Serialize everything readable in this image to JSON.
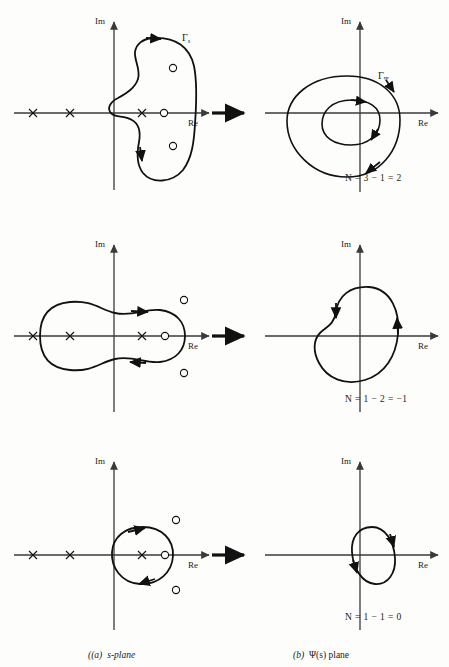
{
  "figure": {
    "type": "diagram",
    "columns": [
      {
        "key": "a",
        "caption_marker": "(a)",
        "caption_text": "s-plane"
      },
      {
        "key": "b",
        "caption_marker": "(b)",
        "caption_text": "Ψ(s) plane"
      }
    ],
    "axis_labels": {
      "imaginary": "Im",
      "real": "Re"
    },
    "contour_labels": {
      "s_plane": "Γ",
      "s_plane_sub": "s",
      "psi_plane": "Γ",
      "psi_plane_sub": "Ψ"
    },
    "marker_names": {
      "pole": "pole-cross-marker",
      "zero": "zero-circle-marker",
      "arrow": "map-arrow-icon",
      "direction": "direction-arrowhead"
    },
    "rows": [
      {
        "id": "row-1",
        "n_equation": "N = 3 − 1 = 2",
        "n_value": 2,
        "enclosed_poles": 3,
        "enclosed_zeros": 1,
        "s_plane": {
          "poles": [
            {
              "x": -4.0,
              "y": 0
            },
            {
              "x": -2.9,
              "y": 0
            },
            {
              "x": -0.8,
              "y": 0
            }
          ],
          "zeros": [
            {
              "x": 0.6,
              "y": 0
            },
            {
              "x": 0.9,
              "y": 1.4
            },
            {
              "x": 0.9,
              "y": -1.4
            }
          ],
          "contour_direction": "clockwise"
        },
        "psi_plane": {
          "encirclements": 2,
          "direction": "clockwise",
          "loops": 2
        }
      },
      {
        "id": "row-2",
        "n_equation": "N = 1 − 2 = −1",
        "n_value": -1,
        "enclosed_poles": 1,
        "enclosed_zeros": 2,
        "s_plane": {
          "poles": [
            {
              "x": -4.0,
              "y": 0
            },
            {
              "x": -2.9,
              "y": 0
            },
            {
              "x": -0.8,
              "y": 0
            }
          ],
          "zeros": [
            {
              "x": 0.6,
              "y": 0
            },
            {
              "x": 1.1,
              "y": 1.4
            },
            {
              "x": 1.1,
              "y": -1.4
            }
          ],
          "contour_direction": "clockwise"
        },
        "psi_plane": {
          "encirclements": -1,
          "direction": "counterclockwise",
          "loops": 1
        }
      },
      {
        "id": "row-3",
        "n_equation": "N = 1 − 1 = 0",
        "n_value": 0,
        "enclosed_poles": 1,
        "enclosed_zeros": 1,
        "s_plane": {
          "poles": [
            {
              "x": -4.0,
              "y": 0
            },
            {
              "x": -2.9,
              "y": 0
            },
            {
              "x": -0.8,
              "y": 0
            }
          ],
          "zeros": [
            {
              "x": 0.6,
              "y": 0
            },
            {
              "x": 1.1,
              "y": 1.4
            },
            {
              "x": 1.1,
              "y": -1.4
            }
          ],
          "contour_direction": "clockwise"
        },
        "psi_plane": {
          "encirclements": 0,
          "direction": "clockwise",
          "loops": 1
        }
      }
    ],
    "colors": {
      "ink": "#111111",
      "axis": "#3a3a3a",
      "paper": "#fdfdfb"
    }
  }
}
